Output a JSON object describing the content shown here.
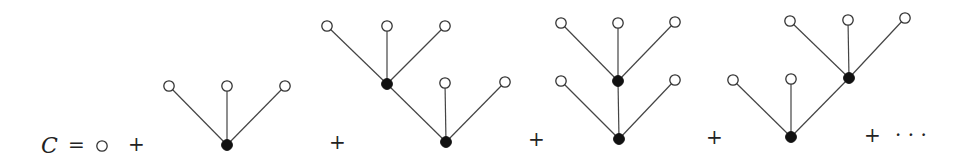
{
  "equation": {
    "lhs": "C",
    "equals": "=",
    "plus": "+",
    "ellipsis": "…",
    "colors": {
      "edge": "#444444",
      "leaf_fill": "#ffffff",
      "leaf_stroke": "#333333",
      "inner_fill": "#111111"
    }
  },
  "terms": [
    {
      "name": "single-leaf",
      "nodes": [
        {
          "x": 102,
          "y": 146,
          "type": "leaf"
        }
      ],
      "edges": []
    },
    {
      "name": "tree-1",
      "nodes": [
        {
          "x": 227,
          "y": 145,
          "type": "inner"
        },
        {
          "x": 169,
          "y": 86,
          "type": "leaf"
        },
        {
          "x": 227,
          "y": 86,
          "type": "leaf"
        },
        {
          "x": 285,
          "y": 86,
          "type": "leaf"
        }
      ],
      "edges": [
        [
          0,
          1
        ],
        [
          0,
          2
        ],
        [
          0,
          3
        ]
      ]
    },
    {
      "name": "tree-2",
      "nodes": [
        {
          "x": 446,
          "y": 142,
          "type": "inner"
        },
        {
          "x": 387,
          "y": 84,
          "type": "inner"
        },
        {
          "x": 445,
          "y": 83,
          "type": "leaf"
        },
        {
          "x": 505,
          "y": 82,
          "type": "leaf"
        },
        {
          "x": 327,
          "y": 26,
          "type": "leaf"
        },
        {
          "x": 387,
          "y": 26,
          "type": "leaf"
        },
        {
          "x": 445,
          "y": 26,
          "type": "leaf"
        }
      ],
      "edges": [
        [
          0,
          1
        ],
        [
          0,
          2
        ],
        [
          0,
          3
        ],
        [
          1,
          4
        ],
        [
          1,
          5
        ],
        [
          1,
          6
        ]
      ]
    },
    {
      "name": "tree-3",
      "nodes": [
        {
          "x": 619,
          "y": 139,
          "type": "inner"
        },
        {
          "x": 561,
          "y": 81,
          "type": "leaf"
        },
        {
          "x": 618,
          "y": 81,
          "type": "inner"
        },
        {
          "x": 675,
          "y": 80,
          "type": "leaf"
        },
        {
          "x": 561,
          "y": 23,
          "type": "leaf"
        },
        {
          "x": 618,
          "y": 23,
          "type": "leaf"
        },
        {
          "x": 675,
          "y": 22,
          "type": "leaf"
        }
      ],
      "edges": [
        [
          0,
          1
        ],
        [
          0,
          2
        ],
        [
          0,
          3
        ],
        [
          2,
          4
        ],
        [
          2,
          5
        ],
        [
          2,
          6
        ]
      ]
    },
    {
      "name": "tree-4",
      "nodes": [
        {
          "x": 791,
          "y": 137,
          "type": "inner"
        },
        {
          "x": 733,
          "y": 80,
          "type": "leaf"
        },
        {
          "x": 791,
          "y": 79,
          "type": "leaf"
        },
        {
          "x": 849,
          "y": 78,
          "type": "inner"
        },
        {
          "x": 790,
          "y": 21,
          "type": "leaf"
        },
        {
          "x": 848,
          "y": 20,
          "type": "leaf"
        },
        {
          "x": 905,
          "y": 18,
          "type": "leaf"
        }
      ],
      "edges": [
        [
          0,
          1
        ],
        [
          0,
          2
        ],
        [
          0,
          3
        ],
        [
          3,
          4
        ],
        [
          3,
          5
        ],
        [
          3,
          6
        ]
      ]
    }
  ],
  "symbols": [
    {
      "text": "C",
      "x": 41,
      "y": 153,
      "kind": "lhs"
    },
    {
      "text": "=",
      "x": 68,
      "y": 152,
      "kind": "op"
    },
    {
      "text": "+",
      "x": 128,
      "y": 151,
      "kind": "op"
    },
    {
      "text": "+",
      "x": 329,
      "y": 149,
      "kind": "op"
    },
    {
      "text": "+",
      "x": 528,
      "y": 146,
      "kind": "op"
    },
    {
      "text": "+",
      "x": 706,
      "y": 144,
      "kind": "op"
    },
    {
      "text": "+",
      "x": 864,
      "y": 142,
      "kind": "op"
    },
    {
      "text": "· · ·",
      "x": 895,
      "y": 142,
      "kind": "ellipsis"
    }
  ]
}
